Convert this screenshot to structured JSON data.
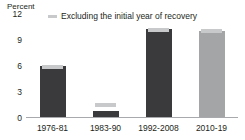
{
  "chart_data": {
    "type": "bar",
    "title": "",
    "subtitle": "",
    "xlabel": "",
    "ylabel": "Percent",
    "ylim": [
      0,
      12
    ],
    "yticks": [
      0,
      3,
      6,
      9,
      12
    ],
    "ytick_labels": [
      "0",
      "3",
      "6",
      "9",
      "12"
    ],
    "grid": false,
    "legend_position": "top-center",
    "categories": [
      "1976-81",
      "1983-90",
      "1992-2008",
      "2010-19"
    ],
    "series": [
      {
        "name": "Total",
        "values": [
          5.9,
          0.7,
          10.1,
          9.9
        ],
        "colors": [
          "#3a3a3c",
          "#3a3a3c",
          "#3a3a3c",
          "#a3a5a7"
        ]
      },
      {
        "name": "Excluding the initial year of recovery",
        "values": [
          6.0,
          1.6,
          10.3,
          10.1
        ],
        "colors": [
          "#c7c9cb",
          "#c7c9cb",
          "#c7c9cb",
          "#c7c9cb"
        ]
      }
    ],
    "annotations": []
  },
  "legend": {
    "marker_name": "legend-dash-marker",
    "label": "Excluding the initial year of recovery",
    "color": "#c7c9cb"
  },
  "axis": {
    "unit_label": "Percent",
    "baseline_color": "#a7a9ac"
  },
  "colors": {
    "background": "#ffffff",
    "text": "#231f20",
    "bar_dark": "#3a3a3c",
    "bar_medium": "#a3a5a7",
    "bar_cap_light": "#c7c9cb",
    "axis_line": "#a7a9ac"
  }
}
